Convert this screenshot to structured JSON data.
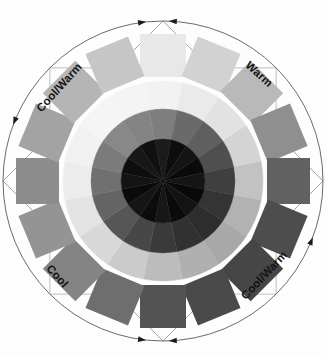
{
  "figure": {
    "name": "grayscale-color-wheel",
    "background_color": "#fdfdfd",
    "width": 327,
    "height": 354
  },
  "wheel": {
    "center_x": 163,
    "center_y": 181,
    "outer_circle_radius": 160,
    "outer_circle_stroke": "#6b6b6b",
    "guide_square_stroke": "#b9b9b9",
    "guide_diamond_stroke": "#9a9a9a",
    "sector_count": 16,
    "sector_start_angle_deg": -90,
    "rings": [
      {
        "name": "inner-ring",
        "inner_radius": 0,
        "outer_radius": 42
      },
      {
        "name": "middle-ring",
        "inner_radius": 42,
        "outer_radius": 72
      },
      {
        "name": "outer-ring",
        "inner_radius": 72,
        "outer_radius": 100
      }
    ],
    "swatch": {
      "name": "outer-rectangle-swatches",
      "inner_radius": 104,
      "outer_radius": 147,
      "half_width": 23
    }
  },
  "sectors": [
    {
      "index": 0,
      "angle_deg": 0,
      "position": "top",
      "inner_color": "#1b1b1b",
      "middle_color": "#7e7e7e",
      "outer_color": "#f2f2f2",
      "swatch_color": "#e8e8e8"
    },
    {
      "index": 1,
      "angle_deg": 22.5,
      "position": "top-right-1",
      "inner_color": "#0d0d0d",
      "middle_color": "#6a6a6a",
      "outer_color": "#eaeaea",
      "swatch_color": "#d2d2d2"
    },
    {
      "index": 2,
      "angle_deg": 45,
      "position": "top-right-2",
      "inner_color": "#141414",
      "middle_color": "#5f5f5f",
      "outer_color": "#e2e2e2",
      "swatch_color": "#b9b9b9"
    },
    {
      "index": 3,
      "angle_deg": 67.5,
      "position": "right-upper",
      "inner_color": "#0a0a0a",
      "middle_color": "#4f4f4f",
      "outer_color": "#d4d4d4",
      "swatch_color": "#8f8f8f"
    },
    {
      "index": 4,
      "angle_deg": 90,
      "position": "right",
      "inner_color": "#151515",
      "middle_color": "#3f3f3f",
      "outer_color": "#c2c2c2",
      "swatch_color": "#616161"
    },
    {
      "index": 5,
      "angle_deg": 112.5,
      "position": "right-lower",
      "inner_color": "#090909",
      "middle_color": "#343434",
      "outer_color": "#b2b2b2",
      "swatch_color": "#4d4d4d"
    },
    {
      "index": 6,
      "angle_deg": 135,
      "position": "bottom-right-2",
      "inner_color": "#131313",
      "middle_color": "#2d2d2d",
      "outer_color": "#a8a8a8",
      "swatch_color": "#464646"
    },
    {
      "index": 7,
      "angle_deg": 157.5,
      "position": "bottom-right-1",
      "inner_color": "#0b0b0b",
      "middle_color": "#313131",
      "outer_color": "#b0b0b0",
      "swatch_color": "#4a4a4a"
    },
    {
      "index": 8,
      "angle_deg": 180,
      "position": "bottom",
      "inner_color": "#171717",
      "middle_color": "#3a3a3a",
      "outer_color": "#bcbcbc",
      "swatch_color": "#535353"
    },
    {
      "index": 9,
      "angle_deg": 202.5,
      "position": "bottom-left-1",
      "inner_color": "#0c0c0c",
      "middle_color": "#474747",
      "outer_color": "#cbcbcb",
      "swatch_color": "#6e6e6e"
    },
    {
      "index": 10,
      "angle_deg": 225,
      "position": "bottom-left-2",
      "inner_color": "#151515",
      "middle_color": "#565656",
      "outer_color": "#d8d8d8",
      "swatch_color": "#848484"
    },
    {
      "index": 11,
      "angle_deg": 247.5,
      "position": "left-lower",
      "inner_color": "#0a0a0a",
      "middle_color": "#646464",
      "outer_color": "#e3e3e3",
      "swatch_color": "#949494"
    },
    {
      "index": 12,
      "angle_deg": 270,
      "position": "left",
      "inner_color": "#141414",
      "middle_color": "#707070",
      "outer_color": "#ececec",
      "swatch_color": "#8d8d8d"
    },
    {
      "index": 13,
      "angle_deg": 292.5,
      "position": "left-upper",
      "inner_color": "#0e0e0e",
      "middle_color": "#7b7b7b",
      "outer_color": "#f1f1f1",
      "swatch_color": "#a3a3a3"
    },
    {
      "index": 14,
      "angle_deg": 315,
      "position": "top-left-2",
      "inner_color": "#171717",
      "middle_color": "#888888",
      "outer_color": "#f5f5f5",
      "swatch_color": "#b5b5b5"
    },
    {
      "index": 15,
      "angle_deg": 337.5,
      "position": "top-left-1",
      "inner_color": "#101010",
      "middle_color": "#848484",
      "outer_color": "#f4f4f4",
      "swatch_color": "#c6c6c6"
    }
  ],
  "labels": {
    "top_left": {
      "text": "Cool/Warm",
      "arc_angle_deg": -48
    },
    "right": {
      "text": "Warm",
      "arc_angle_deg": 42
    },
    "bottom_left": {
      "text": "Cool",
      "arc_angle_deg": 228
    },
    "bottom_right": {
      "text": "Cool/Warm",
      "arc_angle_deg": 133
    }
  },
  "markers": {
    "top_pair": {
      "name": "top-double-arrow",
      "description": "two arrowheads meeting at top of circle"
    },
    "bottom_pair": {
      "name": "bottom-double-arrow",
      "description": "two arrowheads meeting at bottom of circle"
    },
    "color": "#1a1a1a"
  }
}
